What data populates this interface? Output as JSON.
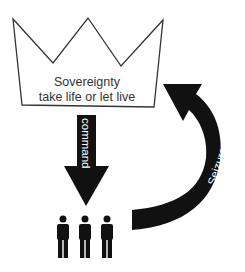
{
  "diagram": {
    "crown": {
      "line1": "Sovereignty",
      "line2": "take life or let live"
    },
    "command_arrow": {
      "label": "command"
    },
    "seizure_arrow": {
      "label": "Seizure"
    },
    "people": {
      "count": 3
    },
    "colors": {
      "stroke": "#333333",
      "arrow_fill": "#111111",
      "text": "#333333",
      "arrow_text": "#ffffff",
      "background": "#ffffff"
    }
  }
}
